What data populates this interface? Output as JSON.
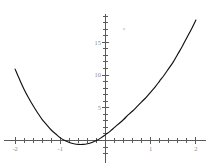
{
  "chart_data": {
    "type": "line",
    "title": "",
    "subtitle": "",
    "xlabel": "",
    "ylabel": "",
    "xlim": [
      -2.15,
      2.15
    ],
    "ylim": [
      -2.0,
      19.5
    ],
    "grid": false,
    "legend": null,
    "axis_style": "centered-cross",
    "x_ticks_major": [
      -2,
      -1,
      1,
      2
    ],
    "x_tick_labels": [
      "-2",
      "-1",
      "1",
      "2"
    ],
    "y_ticks_major": [
      5,
      10,
      15
    ],
    "y_tick_labels": [
      "5",
      "10",
      "15"
    ],
    "x_tick_minor_step": 0.2,
    "y_tick_minor_step": 1,
    "series": [
      {
        "name": "curve",
        "color": "#111111",
        "x": [
          -2.0,
          -1.9,
          -1.8,
          -1.7,
          -1.6,
          -1.5,
          -1.4,
          -1.3,
          -1.2,
          -1.1,
          -1.0,
          -0.9,
          -0.8,
          -0.7,
          -0.6,
          -0.5,
          -0.4,
          -0.3,
          -0.2,
          -0.1,
          0.0,
          0.1,
          0.2,
          0.3,
          0.4,
          0.5,
          0.6,
          0.7,
          0.8,
          0.9,
          1.0,
          1.1,
          1.2,
          1.3,
          1.4,
          1.5,
          1.6,
          1.7,
          1.8,
          1.9,
          2.0
        ],
        "y": [
          10.9,
          9.3,
          7.8,
          6.5,
          5.3,
          4.2,
          3.2,
          2.4,
          1.6,
          1.0,
          0.4,
          0.0,
          -0.3,
          -0.5,
          -0.6,
          -0.6,
          -0.5,
          -0.3,
          0.0,
          0.4,
          0.9,
          1.4,
          2.0,
          2.6,
          3.2,
          3.9,
          4.5,
          5.2,
          5.9,
          6.6,
          7.4,
          8.2,
          9.1,
          10.0,
          11.0,
          12.0,
          13.2,
          14.4,
          15.7,
          17.0,
          18.4
        ]
      }
    ],
    "colors": {
      "curve": "#111111",
      "axis": "#5a5a5a",
      "tick_label": "#8c8c8c",
      "background": "#ffffff"
    }
  }
}
